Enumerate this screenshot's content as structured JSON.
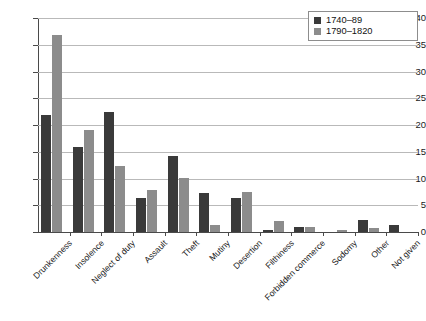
{
  "chart_data": {
    "type": "bar",
    "title": "",
    "xlabel": "",
    "ylabel": "",
    "ylim": [
      0,
      40
    ],
    "ytick_step": 5,
    "grid": true,
    "legend_position": "top-right",
    "categories": [
      "Drunkenness",
      "Insolence",
      "Neglect of duty",
      "Assault",
      "Theft",
      "Mutiny",
      "Desertion",
      "Filthiness",
      "Forbidden commerce",
      "Sodomy",
      "Other",
      "Not given"
    ],
    "yticks": [
      "0",
      "5",
      "10",
      "15",
      "20",
      "25",
      "30",
      "35",
      "40"
    ],
    "series": [
      {
        "name": "1740–89",
        "color": "#3a3a3a",
        "values": [
          21.8,
          15.8,
          22.4,
          6.3,
          14.3,
          7.2,
          6.4,
          0.3,
          1.0,
          0.0,
          2.2,
          1.4
        ]
      },
      {
        "name": "1790–1820",
        "color": "#8c8c8c",
        "values": [
          36.8,
          19.0,
          12.3,
          7.9,
          10.1,
          1.3,
          7.4,
          2.1,
          1.0,
          0.3,
          0.7,
          0.0
        ]
      }
    ]
  }
}
